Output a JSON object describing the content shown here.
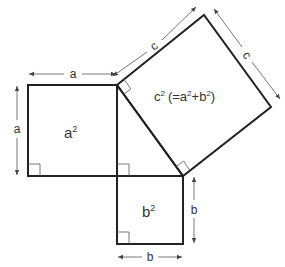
{
  "diagram": {
    "labels": {
      "side_a_top": "a",
      "side_a_left": "a",
      "side_b_right": "b",
      "side_b_bottom": "b",
      "side_c_top": "c",
      "side_c_right": "c",
      "area_a": "a",
      "area_b": "b",
      "area_c": "c",
      "area_c_formula_open": "(=a",
      "area_c_formula_plus": "+b",
      "area_c_formula_close": ")",
      "exponent": "2"
    },
    "colors": {
      "stroke": "#222222",
      "dimension_line": "#555555",
      "text": "#333333",
      "background": "#ffffff"
    }
  }
}
